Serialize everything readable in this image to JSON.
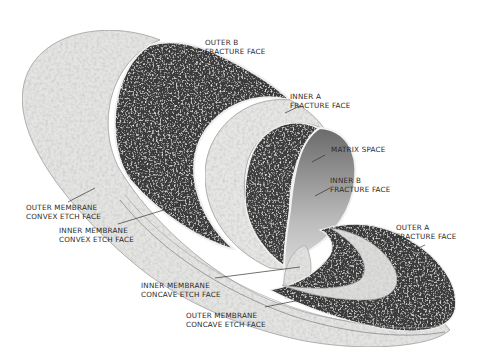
{
  "diagram": {
    "type": "3D cutaway illustration",
    "colors": {
      "background": "#ffffff",
      "etch_face_light": "#e6e6e4",
      "fracture_face_dark": "#3a3a3a",
      "label_text": "#2a2a2a",
      "leader_line": "#333333"
    }
  },
  "labels": [
    {
      "id": "outer-b",
      "line1": "OUTER  B",
      "line2": "FRACTURE FACE"
    },
    {
      "id": "inner-a",
      "line1": "INNER  A",
      "line2": "FRACTURE FACE"
    },
    {
      "id": "matrix-space",
      "line1": "MATRIX SPACE",
      "line2": ""
    },
    {
      "id": "inner-b",
      "line1": "INNER  B",
      "line2": "FRACTURE FACE"
    },
    {
      "id": "outer-a",
      "line1": "OUTER  A",
      "line2": "FRACTURE FACE"
    },
    {
      "id": "outer-membrane-convex",
      "line1": "OUTER MEMBRANE",
      "line2": "CONVEX ETCH FACE"
    },
    {
      "id": "inner-membrane-convex",
      "line1": "INNER MEMBRANE",
      "line2": "CONVEX ETCH FACE"
    },
    {
      "id": "inner-membrane-concave",
      "line1": "INNER MEMBRANE",
      "line2": "CONCAVE ETCH FACE"
    },
    {
      "id": "outer-membrane-concave",
      "line1": "OUTER MEMBRANE",
      "line2": "CONCAVE ETCH FACE"
    }
  ]
}
